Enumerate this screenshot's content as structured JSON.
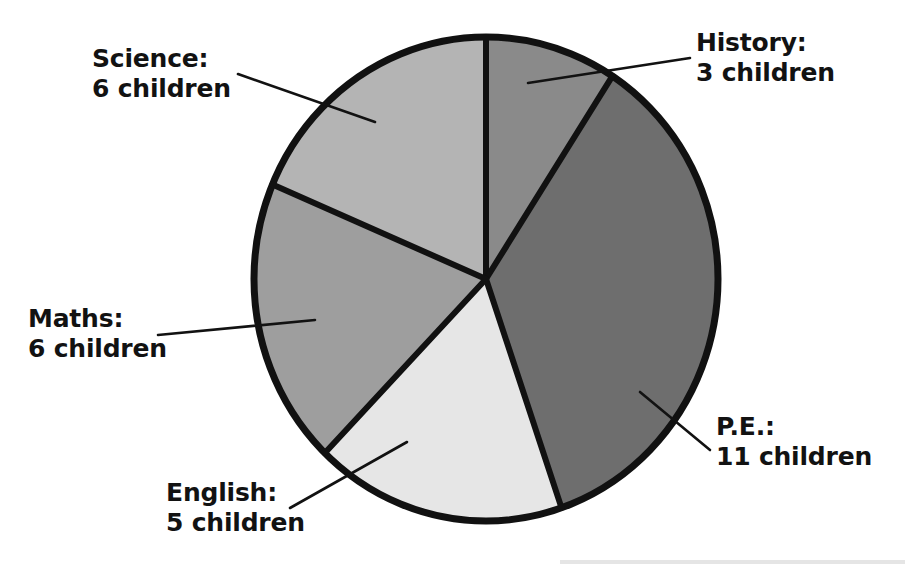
{
  "chart_data": {
    "type": "pie",
    "title": "",
    "subtitle": "",
    "xlabel": "",
    "ylabel": "",
    "unit": "children",
    "total": 31,
    "legend_position": "callout-labels",
    "grid": false,
    "categories": [
      "History",
      "P.E.",
      "English",
      "Maths",
      "Science"
    ],
    "values": [
      3,
      11,
      5,
      6,
      6
    ],
    "slices": [
      {
        "name": "History",
        "value": 3,
        "label_line1": "History:",
        "label_line2": "3 children",
        "color": "#8a8a8a",
        "start_angle_deg": 0,
        "end_angle_deg": 33,
        "label_x": 696,
        "label_y": 28,
        "leader_from": [
          690,
          58
        ],
        "leader_to": [
          528,
          83
        ]
      },
      {
        "name": "P.E.",
        "value": 11,
        "label_line1": "P.E.:",
        "label_line2": "11 children",
        "color": "#6e6e6e",
        "start_angle_deg": 33,
        "end_angle_deg": 161,
        "label_x": 716,
        "label_y": 412,
        "leader_from": [
          710,
          450
        ],
        "leader_to": [
          640,
          392
        ]
      },
      {
        "name": "English",
        "value": 5,
        "label_line1": "English:",
        "label_line2": "5 children",
        "color": "#e6e6e6",
        "start_angle_deg": 161,
        "end_angle_deg": 224,
        "label_x": 166,
        "label_y": 478,
        "leader_from": [
          290,
          508
        ],
        "leader_to": [
          407,
          442
        ]
      },
      {
        "name": "Maths",
        "value": 6,
        "label_line1": "Maths:",
        "label_line2": "6 children",
        "color": "#9e9e9e",
        "start_angle_deg": 224,
        "end_angle_deg": 293,
        "label_x": 28,
        "label_y": 304,
        "leader_from": [
          158,
          335
        ],
        "leader_to": [
          315,
          320
        ]
      },
      {
        "name": "Science",
        "value": 6,
        "label_line1": "Science:",
        "label_line2": "6 children",
        "color": "#b4b4b4",
        "start_angle_deg": 293,
        "end_angle_deg": 360,
        "label_x": 92,
        "label_y": 44,
        "leader_from": [
          238,
          74
        ],
        "leader_to": [
          375,
          122
        ]
      }
    ],
    "geometry": {
      "center_x": 486,
      "center_y": 279,
      "radius_x": 232,
      "radius_y": 242,
      "outline_color": "#111111",
      "outline_width": 7,
      "divider_color": "#111111",
      "divider_width": 6
    },
    "background_color": "#ffffff",
    "text_color": "#121212"
  }
}
